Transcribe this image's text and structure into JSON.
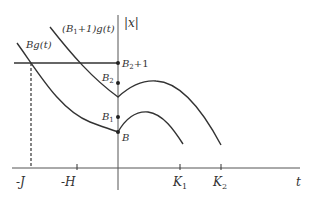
{
  "diagram": {
    "axes": {
      "vertical_label": "|x|",
      "horizontal_label": "t",
      "tick_labels": [
        "-J",
        "-H",
        "K",
        "K"
      ],
      "tick_subscripts": [
        "",
        "",
        "1",
        "2"
      ]
    },
    "curves": [
      {
        "name": "lower-curve",
        "label": "Bg(t)"
      },
      {
        "name": "upper-curve",
        "label": "(B1+1)g(t)",
        "label_prefix": "(B",
        "label_sub": "1",
        "label_suffix": "+1)g(t)"
      }
    ],
    "points": [
      {
        "name": "B2+1",
        "base": "B",
        "sub": "2",
        "suffix": "+1"
      },
      {
        "name": "B2",
        "base": "B",
        "sub": "2",
        "suffix": ""
      },
      {
        "name": "B1",
        "base": "B",
        "sub": "1",
        "suffix": ""
      },
      {
        "name": "B",
        "base": "B",
        "sub": "",
        "suffix": ""
      }
    ],
    "colors": {
      "line": "#333333",
      "background": "#ffffff"
    }
  }
}
